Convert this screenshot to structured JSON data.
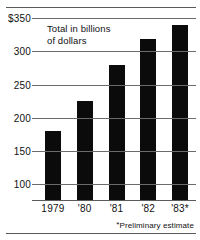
{
  "chart_data": {
    "type": "bar",
    "title": "",
    "xlabel": "",
    "ylabel": "Total in billions\nof dollars",
    "categories": [
      "1979",
      "'80",
      "'81",
      "'82",
      "'83*"
    ],
    "values": [
      180,
      225,
      280,
      318,
      340
    ],
    "ylim": [
      75,
      350
    ],
    "yticks": [
      100,
      150,
      200,
      250,
      300,
      350
    ],
    "ytick_labels": [
      "100",
      "150",
      "200",
      "250",
      "300",
      "$350"
    ],
    "grid": true,
    "legend": "none",
    "bar_color": "#0b0b0b",
    "grid_color": "#6b6b6b",
    "annotations": {
      "footnote_marker": "*",
      "footnote_text": "Preliminary estimate"
    }
  }
}
